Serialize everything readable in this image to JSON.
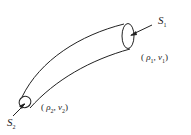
{
  "diagram": {
    "title": "",
    "surfaces": [
      {
        "id": "S1",
        "label": "S",
        "subscript": "1",
        "state": "(ρ₁, v₁)",
        "rho": "ρ",
        "rho_sub": "1",
        "v": "v",
        "v_sub": "1"
      },
      {
        "id": "S2",
        "label": "S",
        "subscript": "2",
        "state": "(ρ₂, v₂)",
        "rho": "ρ",
        "rho_sub": "2",
        "v": "v",
        "v_sub": "2"
      }
    ],
    "colors": {
      "stroke": "#222222",
      "background": "#ffffff"
    }
  }
}
